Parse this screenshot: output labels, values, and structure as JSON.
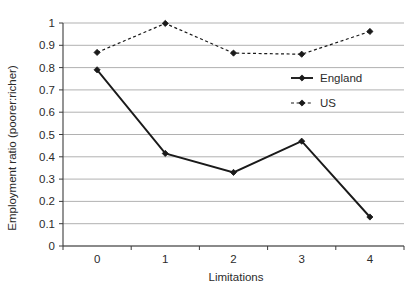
{
  "chart_data": {
    "type": "line",
    "title": "",
    "xlabel": "Limitations",
    "ylabel": "Employment ratio (poorer:richer)",
    "x": [
      0,
      1,
      2,
      3,
      4
    ],
    "xtick_labels": [
      "0",
      "1",
      "2",
      "3",
      "4"
    ],
    "ytick_labels": [
      "0",
      "0.1",
      "0.2",
      "0.3",
      "0.4",
      "0.5",
      "0.6",
      "0.7",
      "0.8",
      "0.9",
      "1"
    ],
    "ytick_values": [
      0,
      0.1,
      0.2,
      0.3,
      0.4,
      0.5,
      0.6,
      0.7,
      0.8,
      0.9,
      1
    ],
    "xlim": [
      -0.5,
      4.5
    ],
    "ylim": [
      0,
      1
    ],
    "grid": "horizontal",
    "legend_position": "right-upper",
    "series": [
      {
        "name": "England",
        "values": [
          0.79,
          0.415,
          0.33,
          0.47,
          0.13
        ],
        "line_style": "solid",
        "marker": "diamond",
        "color": "#1a1a1a"
      },
      {
        "name": "US",
        "values": [
          0.868,
          0.998,
          0.865,
          0.86,
          0.962
        ],
        "line_style": "dashed",
        "marker": "diamond",
        "color": "#1a1a1a"
      }
    ],
    "colors": {
      "axis": "#3c3c3c",
      "grid": "#a8a8a8",
      "series_england": "#1a1a1a",
      "series_us": "#1a1a1a",
      "text": "#2b2b2b",
      "background": "#ffffff"
    }
  }
}
